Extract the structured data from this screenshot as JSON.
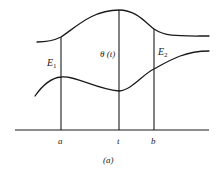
{
  "figure": {
    "caption": "(a)",
    "labels": {
      "E1_main": "E",
      "E1_sub": "1",
      "theta": "θ (t)",
      "E2_main": "E",
      "E2_sub": "2"
    },
    "axis_ticks": [
      {
        "label": "a",
        "x": 61
      },
      {
        "label": "t",
        "x": 119
      },
      {
        "label": "b",
        "x": 154
      }
    ],
    "upper_curve_description": "upper boundary curve, rising to a maximum at t",
    "lower_curve_description": "lower boundary curve, with local max near a and local min at t",
    "colors": {
      "ink": "#1a1a1a",
      "background": "#ffffff"
    }
  }
}
